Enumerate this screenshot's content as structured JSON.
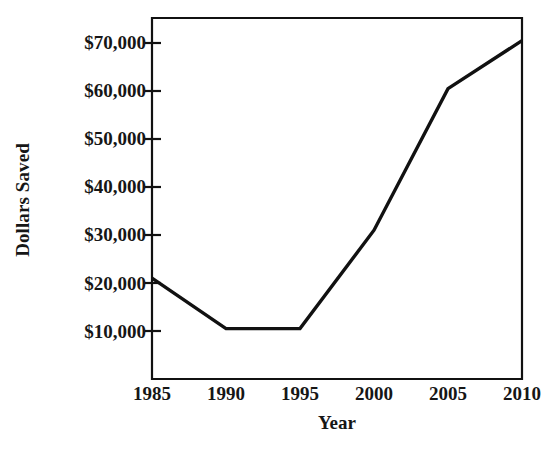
{
  "chart_data": {
    "type": "line",
    "title": "",
    "xlabel": "Year",
    "ylabel": "Dollars Saved",
    "categories": [
      "1985",
      "1990",
      "1995",
      "2000",
      "2005",
      "2010"
    ],
    "x": [
      1985,
      1990,
      1995,
      2000,
      2005,
      2010
    ],
    "values": [
      21000,
      10500,
      10500,
      31000,
      60500,
      70500
    ],
    "series": [
      {
        "name": "Dollars Saved",
        "values": [
          21000,
          10500,
          10500,
          31000,
          60500,
          70500
        ]
      }
    ],
    "ylim": [
      0,
      75000
    ],
    "xlim": [
      1985,
      2010
    ],
    "y_tick_values": [
      10000,
      20000,
      30000,
      40000,
      50000,
      60000,
      70000
    ],
    "y_tick_labels": [
      "$10,000",
      "$20,000",
      "$30,000",
      "$40,000",
      "$50,000",
      "$60,000",
      "$70,000"
    ],
    "x_tick_labels": [
      "1985",
      "1990",
      "1995",
      "2000",
      "2005",
      "2010"
    ],
    "grid": false,
    "legend": false,
    "legend_position": "none",
    "line_color": "#111111",
    "plot_background": "#ffffff",
    "axis_color": "#111111",
    "markers": false
  },
  "axes": {
    "y_title": "Dollars Saved",
    "x_title": "Year"
  },
  "colors": {
    "ink": "#111111",
    "background": "#ffffff",
    "line": "#111111"
  }
}
